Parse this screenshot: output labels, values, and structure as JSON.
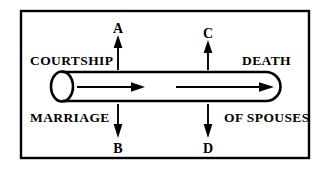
{
  "diagram": {
    "frame": {
      "border_color": "#000000",
      "background_color": "#ffffff"
    },
    "tube": {
      "name": "marriage-tube",
      "left_end": "open",
      "right_end": "closed-rounded",
      "stroke_color": "#000000",
      "flow_arrows": 2,
      "flow_direction": "left-to-right"
    },
    "stage_labels": {
      "top_left": "COURTSHIP",
      "top_right": "DEATH",
      "bottom_left": "MARRIAGE",
      "bottom_right": "OF SPOUSES"
    },
    "point_labels": {
      "a": "A",
      "b": "B",
      "c": "C",
      "d": "D"
    },
    "markers": [
      {
        "id": "a",
        "label": "A",
        "direction": "up",
        "side": "top",
        "x": 118
      },
      {
        "id": "c",
        "label": "C",
        "direction": "up",
        "side": "top",
        "x": 208
      },
      {
        "id": "b",
        "label": "B",
        "direction": "down",
        "side": "bottom",
        "x": 118
      },
      {
        "id": "d",
        "label": "D",
        "direction": "down",
        "side": "bottom",
        "x": 208
      }
    ]
  }
}
